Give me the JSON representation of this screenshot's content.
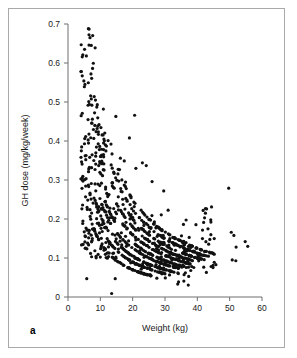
{
  "figure": {
    "panel_label": "a",
    "border_color": "#a9a9a9",
    "background": "#ffffff"
  },
  "chart_data": {
    "type": "scatter",
    "title": "",
    "xlabel": "Weight (kg)",
    "ylabel": "GH dose (mg/kg/week)",
    "xlim": [
      0,
      60
    ],
    "ylim": [
      0,
      0.7
    ],
    "xticks": [
      0,
      10,
      20,
      30,
      40,
      50,
      60
    ],
    "yticks": [
      0,
      0.1,
      0.2,
      0.3,
      0.4,
      0.5,
      0.6,
      0.7
    ],
    "xtick_labels": [
      "0",
      "10",
      "20",
      "30",
      "40",
      "50",
      "60"
    ],
    "ytick_labels": [
      "0",
      "0.1",
      "0.2",
      "0.3",
      "0.4",
      "0.5",
      "0.6",
      "0.7"
    ],
    "grid": false,
    "legend": null,
    "marker_color": "#111111",
    "marker_size": 1.6,
    "n_points": 812,
    "hyperbola_bands": [
      {
        "total_dose_mg_per_week": 1.4,
        "weight_range": [
          4,
          26
        ]
      },
      {
        "total_dose_mg_per_week": 1.8,
        "weight_range": [
          4,
          30
        ]
      },
      {
        "total_dose_mg_per_week": 2.1,
        "weight_range": [
          5,
          32
        ]
      },
      {
        "total_dose_mg_per_week": 2.5,
        "weight_range": [
          5,
          34
        ]
      },
      {
        "total_dose_mg_per_week": 2.8,
        "weight_range": [
          6,
          36
        ]
      },
      {
        "total_dose_mg_per_week": 3.2,
        "weight_range": [
          6,
          38
        ]
      },
      {
        "total_dose_mg_per_week": 3.6,
        "weight_range": [
          7,
          40
        ]
      },
      {
        "total_dose_mg_per_week": 4.0,
        "weight_range": [
          7,
          42
        ]
      },
      {
        "total_dose_mg_per_week": 4.5,
        "weight_range": [
          8,
          44
        ]
      },
      {
        "total_dose_mg_per_week": 5.0,
        "weight_range": [
          9,
          45
        ]
      }
    ],
    "outliers": [
      [
        6.3,
        0.688
      ],
      [
        6.8,
        0.665
      ],
      [
        7.2,
        0.645
      ],
      [
        4.4,
        0.567
      ],
      [
        4.9,
        0.554
      ],
      [
        7.6,
        0.586
      ],
      [
        7.1,
        0.572
      ],
      [
        7.0,
        0.516
      ],
      [
        7.2,
        0.508
      ],
      [
        8.5,
        0.505
      ],
      [
        6.6,
        0.494
      ],
      [
        8.9,
        0.487
      ],
      [
        6.2,
        0.455
      ],
      [
        7.4,
        0.446
      ],
      [
        8.3,
        0.44
      ],
      [
        9.0,
        0.432
      ],
      [
        8.7,
        0.424
      ],
      [
        9.4,
        0.417
      ],
      [
        14.8,
        0.463
      ],
      [
        20.6,
        0.466
      ],
      [
        19.0,
        0.408
      ],
      [
        5.1,
        0.393
      ],
      [
        9.8,
        0.386
      ],
      [
        11.0,
        0.378
      ],
      [
        13.3,
        0.392
      ],
      [
        5.5,
        0.352
      ],
      [
        10.2,
        0.36
      ],
      [
        16.2,
        0.356
      ],
      [
        17.4,
        0.349
      ],
      [
        23.0,
        0.344
      ],
      [
        24.2,
        0.337
      ],
      [
        21.0,
        0.33
      ],
      [
        4.0,
        0.303
      ],
      [
        26.0,
        0.296
      ],
      [
        29.6,
        0.272
      ],
      [
        49.7,
        0.279
      ],
      [
        41.8,
        0.222
      ],
      [
        42.5,
        0.215
      ],
      [
        44.2,
        0.192
      ],
      [
        50.5,
        0.166
      ],
      [
        51.3,
        0.158
      ],
      [
        54.8,
        0.142
      ],
      [
        55.6,
        0.13
      ],
      [
        52.0,
        0.128
      ],
      [
        50.8,
        0.095
      ],
      [
        51.9,
        0.093
      ],
      [
        30.1,
        0.049
      ],
      [
        13.5,
        0.009
      ],
      [
        14.6,
        0.047
      ],
      [
        5.8,
        0.047
      ],
      [
        42.8,
        0.063
      ],
      [
        35.6,
        0.09
      ],
      [
        37.2,
        0.098
      ]
    ]
  }
}
